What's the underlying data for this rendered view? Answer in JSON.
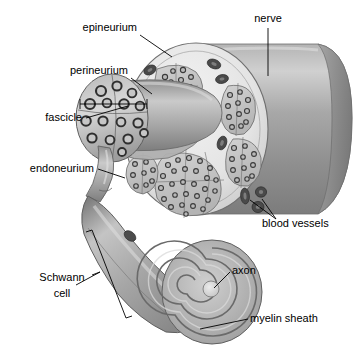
{
  "figure": {
    "background_color": "#ffffff",
    "width": 361,
    "height": 353
  },
  "palette": {
    "line": "#000000",
    "cylinder_body": "#9a9a9a",
    "cylinder_highlight": "#c9c9c9",
    "cut_face": "#e8e8e8",
    "epineurium_fill": "#e2e2e2",
    "fascicle_fill": "#c5c5c5",
    "axon_fill": "#b9b9b9",
    "axon_outline": "#3a3a3a",
    "vessel_fill": "#4a4a4a",
    "myelin_dark": "#8a8a8a",
    "myelin_light": "#cfcfcf",
    "axon_core": "#dcdcdc"
  },
  "labels": [
    {
      "id": "epineurium",
      "text": "epineurium",
      "x": 137,
      "y": 31,
      "anchor": "end"
    },
    {
      "id": "nerve",
      "text": "nerve",
      "x": 268,
      "y": 22,
      "anchor": "middle"
    },
    {
      "id": "perineurium",
      "text": "perineurium",
      "x": 128,
      "y": 74,
      "anchor": "end"
    },
    {
      "id": "fascicle",
      "text": "fascicle",
      "x": 82,
      "y": 121,
      "anchor": "end"
    },
    {
      "id": "endoneurium",
      "text": "endoneurium",
      "x": 94,
      "y": 172,
      "anchor": "end"
    },
    {
      "id": "blood-vessels",
      "text": "blood vessels",
      "x": 262,
      "y": 227,
      "anchor": "start"
    },
    {
      "id": "axon",
      "text": "axon",
      "x": 232,
      "y": 274,
      "anchor": "start"
    },
    {
      "id": "schwann-cell-line1",
      "text": "Schwann",
      "x": 62,
      "y": 281,
      "anchor": "middle"
    },
    {
      "id": "schwann-cell-line2",
      "text": "cell",
      "x": 62,
      "y": 297,
      "anchor": "middle"
    },
    {
      "id": "myelin-sheath",
      "text": "myelin sheath",
      "x": 250,
      "y": 322,
      "anchor": "start"
    }
  ],
  "structures": {
    "nerve_trunk": "cylindrical nerve trunk with cut proximal face",
    "cut_face": "elliptical cross-section showing epineurium, fascicles and blood vessels",
    "protruding_fascicle": "fascicle pulled forward out of the cut face showing perineurium",
    "endoneurium_tube": "tapering tube descending from protruding fascicle",
    "schwann_cell": "elongated Schwann cell wrapping into a myelin spiral",
    "myelin_spiral": "concentric spiral of myelin lamellae around a central axon",
    "blood_vessels": "dark oval vessels embedded in the epineurium"
  },
  "counts": {
    "fascicles_on_face": 6,
    "blood_vessels_visible": 9,
    "myelin_spiral_turns": 6
  }
}
